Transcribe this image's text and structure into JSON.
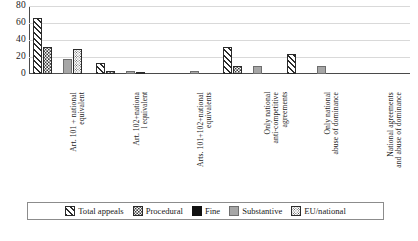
{
  "chart_data": {
    "type": "bar",
    "title": "",
    "xlabel": "",
    "ylabel": "",
    "ylim": [
      0,
      80
    ],
    "yticks": [
      "0",
      "20",
      "40",
      "60",
      "80"
    ],
    "grid": true,
    "legend_position": "bottom",
    "categories": [
      "Art. 101 + national\nequivalent",
      "Art. 102+nationa\nl equivalent",
      "Arts. 101+102+national\nequivalents",
      "Only national\nanti-competitive\nagreements",
      "Only national\nabuse of dominance",
      "National agreements\nand abuse of dominance"
    ],
    "series": [
      {
        "name": "Total appeals",
        "pattern": "diagonal-hatch",
        "values": [
          66,
          13,
          0,
          32,
          23,
          0
        ]
      },
      {
        "name": "Procedural",
        "pattern": "dotted",
        "values": [
          32,
          4,
          0,
          10,
          0,
          0
        ]
      },
      {
        "name": "Fine",
        "pattern": "solid-black",
        "values": [
          0,
          0,
          0,
          0,
          0,
          0
        ]
      },
      {
        "name": "Substantive",
        "pattern": "solid-gray",
        "values": [
          18,
          4,
          3,
          10,
          10,
          0
        ]
      },
      {
        "name": "EU/national",
        "pattern": "fine-dotted",
        "values": [
          30,
          2,
          0,
          0,
          0,
          0
        ]
      }
    ]
  },
  "legend": {
    "items": [
      {
        "label": "Total appeals"
      },
      {
        "label": "Procedural"
      },
      {
        "label": "Fine"
      },
      {
        "label": "Substantive"
      },
      {
        "label": "EU/national"
      }
    ]
  },
  "colors": {
    "axis": "#4a4a4a",
    "grid": "#d9d9d9",
    "substantive": "#a6a6a6",
    "fine": "#111111",
    "outline": "#2b2b2b"
  }
}
